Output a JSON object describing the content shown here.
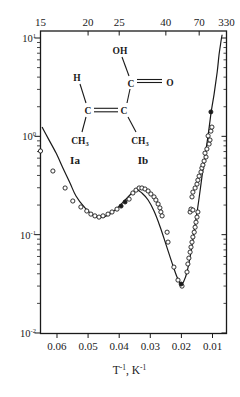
{
  "figure": {
    "background": "#ffffff",
    "ink": "#1a1a1a"
  },
  "chart_data": {
    "type": "scatter",
    "title": "",
    "xlabel_parts": [
      {
        "t": "T"
      },
      {
        "t": "-1",
        "sup": true
      },
      {
        "t": ", K"
      },
      {
        "t": "-1",
        "sup": true
      }
    ],
    "x_axis": {
      "ticks": [
        0.06,
        0.05,
        0.04,
        0.03,
        0.02,
        0.01
      ],
      "tick_labels": [
        "0.06",
        "0.05",
        "0.04",
        "0.03",
        "0.02",
        "0.01"
      ],
      "xlim": [
        0.0653,
        0.0055
      ],
      "direction": "value-decreases-to-right"
    },
    "top_axis": {
      "unit": "K",
      "ticks": [
        15,
        20,
        25,
        40,
        70,
        330
      ],
      "tick_labels": [
        "15",
        "20",
        "25",
        "40",
        "70",
        "330"
      ]
    },
    "y_axis": {
      "scale": "log",
      "base": "10",
      "ylim": [
        0.01,
        10
      ],
      "decade_exponents": [
        "1",
        "0",
        "-1",
        "-2"
      ]
    },
    "series": [
      {
        "name": "experimental-open-circles",
        "marker": "open-circle",
        "points": [
          [
            0.0655,
            0.71
          ],
          [
            0.0613,
            0.444
          ],
          [
            0.0574,
            0.298
          ],
          [
            0.0549,
            0.22
          ],
          [
            0.0523,
            0.191
          ],
          [
            0.0504,
            0.174
          ],
          [
            0.0491,
            0.162
          ],
          [
            0.0478,
            0.155
          ],
          [
            0.0465,
            0.151
          ],
          [
            0.0452,
            0.155
          ],
          [
            0.0436,
            0.162
          ],
          [
            0.0423,
            0.17
          ],
          [
            0.0407,
            0.182
          ],
          [
            0.0368,
            0.23
          ],
          [
            0.0356,
            0.265
          ],
          [
            0.0346,
            0.284
          ],
          [
            0.0336,
            0.298
          ],
          [
            0.0327,
            0.298
          ],
          [
            0.0317,
            0.291
          ],
          [
            0.0307,
            0.278
          ],
          [
            0.0298,
            0.259
          ],
          [
            0.0288,
            0.242
          ],
          [
            0.0282,
            0.225
          ],
          [
            0.0275,
            0.205
          ],
          [
            0.0269,
            0.187
          ],
          [
            0.0266,
            0.17
          ],
          [
            0.0262,
            0.155
          ],
          [
            0.0246,
            0.106
          ],
          [
            0.0243,
            0.0841
          ],
          [
            0.0224,
            0.0468
          ],
          [
            0.0211,
            0.0345
          ],
          [
            0.0198,
            0.03
          ],
          [
            0.0182,
            0.0417
          ],
          [
            0.0179,
            0.0503
          ],
          [
            0.0176,
            0.0578
          ],
          [
            0.0172,
            0.0665
          ],
          [
            0.0169,
            0.0748
          ],
          [
            0.0166,
            0.0841
          ],
          [
            0.0163,
            0.0946
          ],
          [
            0.0159,
            0.106
          ],
          [
            0.0156,
            0.119
          ],
          [
            0.0153,
            0.134
          ],
          [
            0.015,
            0.151
          ],
          [
            0.0147,
            0.17
          ],
          [
            0.0172,
            0.17
          ],
          [
            0.0169,
            0.182
          ],
          [
            0.0163,
            0.178
          ],
          [
            0.0166,
            0.242
          ],
          [
            0.0163,
            0.271
          ],
          [
            0.0156,
            0.298
          ],
          [
            0.015,
            0.327
          ],
          [
            0.0147,
            0.359
          ],
          [
            0.0143,
            0.394
          ],
          [
            0.0137,
            0.434
          ],
          [
            0.0134,
            0.476
          ],
          [
            0.0131,
            0.511
          ],
          [
            0.0127,
            0.561
          ],
          [
            0.0121,
            0.616
          ],
          [
            0.0124,
            0.676
          ],
          [
            0.0118,
            0.743
          ],
          [
            0.0111,
            0.835
          ],
          [
            0.0108,
            0.917
          ],
          [
            0.0114,
            1.01
          ],
          [
            0.0105,
            1.13
          ],
          [
            0.0102,
            1.24
          ]
        ]
      },
      {
        "name": "experimental-filled-circles",
        "marker": "filled-circle",
        "points": [
          [
            0.0394,
            0.195
          ],
          [
            0.0381,
            0.215
          ],
          [
            0.0201,
            0.0315
          ],
          [
            0.0105,
            1.77
          ]
        ]
      },
      {
        "name": "model-curve",
        "marker": "none",
        "line": true,
        "points": [
          [
            0.0648,
            1.24
          ],
          [
            0.0629,
            0.96
          ],
          [
            0.0603,
            0.676
          ],
          [
            0.0581,
            0.476
          ],
          [
            0.0558,
            0.335
          ],
          [
            0.0539,
            0.247
          ],
          [
            0.051,
            0.187
          ],
          [
            0.0484,
            0.158
          ],
          [
            0.0462,
            0.149
          ],
          [
            0.0436,
            0.158
          ],
          [
            0.041,
            0.182
          ],
          [
            0.0381,
            0.225
          ],
          [
            0.0359,
            0.265
          ],
          [
            0.0343,
            0.284
          ],
          [
            0.0327,
            0.265
          ],
          [
            0.0307,
            0.225
          ],
          [
            0.0288,
            0.174
          ],
          [
            0.0269,
            0.122
          ],
          [
            0.0249,
            0.0784
          ],
          [
            0.023,
            0.0514
          ],
          [
            0.0214,
            0.0371
          ],
          [
            0.0201,
            0.0315
          ],
          [
            0.0192,
            0.0337
          ],
          [
            0.0182,
            0.0417
          ],
          [
            0.0172,
            0.0592
          ],
          [
            0.0163,
            0.0902
          ],
          [
            0.0153,
            0.144
          ],
          [
            0.0143,
            0.236
          ],
          [
            0.0134,
            0.385
          ],
          [
            0.0124,
            0.631
          ],
          [
            0.0114,
            1.03
          ],
          [
            0.0105,
            1.69
          ],
          [
            0.0095,
            2.69
          ],
          [
            0.0085,
            4.51
          ],
          [
            0.0079,
            6.71
          ],
          [
            0.0072,
            9.55
          ],
          [
            0.0069,
            10.8
          ]
        ]
      }
    ]
  },
  "molecule": {
    "atoms": [
      {
        "t": "OH",
        "x": 120,
        "y": 50
      },
      {
        "t": "H",
        "x": 77,
        "y": 77
      },
      {
        "t": "C",
        "x": 131,
        "y": 83
      },
      {
        "t": "O",
        "x": 170,
        "y": 82
      },
      {
        "t": "C",
        "x": 88,
        "y": 110
      },
      {
        "t": "C",
        "x": 124,
        "y": 110
      },
      {
        "t": "CH",
        "sub": "3",
        "x": 80,
        "y": 140
      },
      {
        "t": "CH",
        "sub": "3",
        "x": 140,
        "y": 140
      }
    ],
    "bonds": [
      [
        122,
        57,
        129,
        76
      ],
      [
        137,
        79.5,
        162,
        79.5
      ],
      [
        137,
        82.5,
        162,
        82.5
      ],
      [
        80,
        84,
        86,
        103
      ],
      [
        94,
        108.3,
        118,
        108.3
      ],
      [
        94,
        111.8,
        118,
        111.8
      ],
      [
        127,
        103,
        130,
        89
      ],
      [
        86,
        117,
        82,
        132
      ],
      [
        128,
        117,
        136,
        132
      ]
    ],
    "isomer_labels": [
      {
        "t": "Ia",
        "x": 75,
        "y": 160
      },
      {
        "t": "Ib",
        "x": 143,
        "y": 160
      }
    ]
  }
}
